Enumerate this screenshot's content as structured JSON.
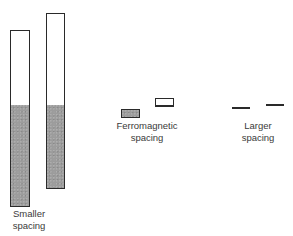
{
  "diagram": {
    "groups": [
      {
        "id": "smaller",
        "label_lines": [
          "Smaller",
          "spacing"
        ],
        "elements": [
          {
            "type": "bar",
            "shaded_fraction": 0.57
          },
          {
            "type": "bar",
            "shaded_fraction": 0.47
          }
        ]
      },
      {
        "id": "ferromagnetic",
        "label_lines": [
          "Ferromagnetic",
          "spacing"
        ],
        "elements": [
          {
            "type": "bar",
            "shaded_fraction": 1.0
          },
          {
            "type": "bar",
            "shaded_fraction": 0.0
          }
        ]
      },
      {
        "id": "larger",
        "label_lines": [
          "Larger",
          "spacing"
        ],
        "elements": [
          {
            "type": "line"
          },
          {
            "type": "line"
          }
        ]
      }
    ],
    "colors": {
      "outline": "#2a2a2a",
      "shading": "#9c9c9c",
      "text": "#3a3a3a"
    }
  }
}
